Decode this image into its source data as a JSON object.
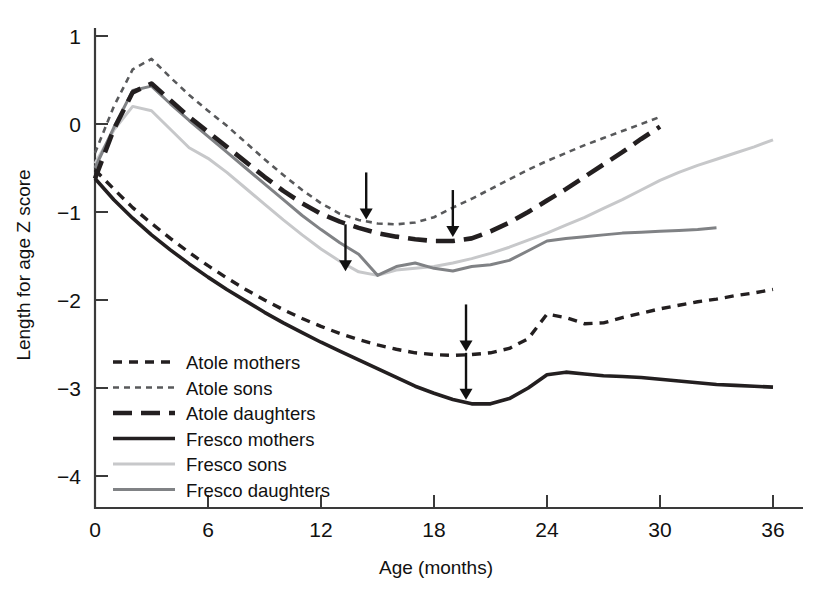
{
  "chart_data": {
    "type": "line",
    "title": "",
    "xlabel": "Age (months)",
    "ylabel": "Length for age Z score",
    "xlim": [
      0,
      36
    ],
    "ylim": [
      -4,
      1
    ],
    "xticks": [
      0,
      6,
      12,
      18,
      24,
      30,
      36
    ],
    "yticks": [
      1,
      0,
      -1,
      -2,
      -3,
      -4
    ],
    "xtick_labels": [
      "0",
      "6",
      "12",
      "18",
      "24",
      "30",
      "36"
    ],
    "ytick_labels": [
      "1",
      "0",
      "−1",
      "−2",
      "−3",
      "−4"
    ],
    "grid": false,
    "legend_position": "lower-left-inside",
    "series": [
      {
        "name": "Atole mothers",
        "style": "dashed",
        "color": "#231f20",
        "x": [
          0,
          1,
          2,
          3,
          4,
          5,
          6,
          7,
          8,
          9,
          10,
          11,
          12,
          13,
          14,
          15,
          16,
          17,
          18,
          19,
          20,
          21,
          22,
          23,
          24,
          25,
          26,
          27,
          28,
          29,
          30,
          31,
          32,
          33,
          34,
          35,
          36
        ],
        "y": [
          -0.52,
          -0.74,
          -0.95,
          -1.13,
          -1.3,
          -1.46,
          -1.61,
          -1.75,
          -1.88,
          -2.0,
          -2.11,
          -2.21,
          -2.3,
          -2.38,
          -2.45,
          -2.51,
          -2.56,
          -2.6,
          -2.62,
          -2.63,
          -2.62,
          -2.6,
          -2.55,
          -2.44,
          -2.16,
          -2.2,
          -2.27,
          -2.26,
          -2.2,
          -2.15,
          -2.1,
          -2.06,
          -2.02,
          -1.99,
          -1.95,
          -1.92,
          -1.88
        ]
      },
      {
        "name": "Atole sons",
        "style": "dashed-fine",
        "color": "#58595b",
        "x": [
          0,
          1,
          2,
          3,
          4,
          5,
          6,
          7,
          8,
          9,
          10,
          11,
          12,
          13,
          14,
          15,
          16,
          17,
          18,
          19,
          20,
          21,
          22,
          23,
          24,
          25,
          26,
          27,
          28,
          29,
          30
        ],
        "y": [
          -0.33,
          0.2,
          0.62,
          0.74,
          0.53,
          0.33,
          0.15,
          -0.02,
          -0.21,
          -0.4,
          -0.58,
          -0.75,
          -0.9,
          -1.02,
          -1.09,
          -1.13,
          -1.14,
          -1.12,
          -1.06,
          -0.95,
          -0.85,
          -0.74,
          -0.63,
          -0.52,
          -0.42,
          -0.33,
          -0.24,
          -0.16,
          -0.08,
          0.0,
          0.08
        ]
      },
      {
        "name": "Atole daughters",
        "style": "long-dash",
        "color": "#231f20",
        "x": [
          0,
          1,
          2,
          3,
          4,
          5,
          6,
          7,
          8,
          9,
          10,
          11,
          12,
          13,
          14,
          15,
          16,
          17,
          18,
          19,
          20,
          21,
          22,
          23,
          24,
          25,
          26,
          27,
          28,
          29,
          30
        ],
        "y": [
          -0.62,
          -0.06,
          0.36,
          0.46,
          0.27,
          0.08,
          -0.09,
          -0.26,
          -0.43,
          -0.6,
          -0.76,
          -0.9,
          -1.02,
          -1.11,
          -1.18,
          -1.24,
          -1.28,
          -1.31,
          -1.33,
          -1.33,
          -1.3,
          -1.22,
          -1.12,
          -1.0,
          -0.87,
          -0.74,
          -0.6,
          -0.46,
          -0.32,
          -0.17,
          -0.03
        ]
      },
      {
        "name": "Fresco mothers",
        "style": "solid",
        "color": "#231f20",
        "x": [
          0,
          1,
          2,
          3,
          4,
          5,
          6,
          7,
          8,
          9,
          10,
          11,
          12,
          13,
          14,
          15,
          16,
          17,
          18,
          19,
          20,
          21,
          22,
          23,
          24,
          25,
          26,
          27,
          28,
          29,
          30,
          31,
          32,
          33,
          34,
          35,
          36
        ],
        "y": [
          -0.62,
          -0.86,
          -1.07,
          -1.26,
          -1.43,
          -1.59,
          -1.74,
          -1.88,
          -2.01,
          -2.14,
          -2.26,
          -2.37,
          -2.48,
          -2.58,
          -2.68,
          -2.78,
          -2.88,
          -2.98,
          -3.06,
          -3.13,
          -3.18,
          -3.18,
          -3.12,
          -3.0,
          -2.85,
          -2.82,
          -2.84,
          -2.86,
          -2.87,
          -2.88,
          -2.9,
          -2.92,
          -2.94,
          -2.96,
          -2.97,
          -2.98,
          -2.99
        ]
      },
      {
        "name": "Fresco sons",
        "style": "solid-light",
        "color": "#c7c8ca",
        "x": [
          0,
          1,
          2,
          3,
          4,
          5,
          6,
          7,
          8,
          9,
          10,
          11,
          12,
          13,
          14,
          15,
          16,
          17,
          18,
          19,
          20,
          21,
          22,
          23,
          24,
          25,
          26,
          27,
          28,
          29,
          30,
          31,
          32,
          33,
          34,
          35,
          36
        ],
        "y": [
          -0.45,
          -0.07,
          0.2,
          0.15,
          -0.06,
          -0.27,
          -0.39,
          -0.55,
          -0.73,
          -0.91,
          -1.09,
          -1.26,
          -1.42,
          -1.56,
          -1.68,
          -1.72,
          -1.66,
          -1.64,
          -1.62,
          -1.58,
          -1.53,
          -1.47,
          -1.4,
          -1.32,
          -1.24,
          -1.15,
          -1.06,
          -0.96,
          -0.86,
          -0.75,
          -0.64,
          -0.55,
          -0.47,
          -0.4,
          -0.33,
          -0.26,
          -0.18
        ]
      },
      {
        "name": "Fresco daughters",
        "style": "solid-mid",
        "color": "#808285",
        "x": [
          0,
          1,
          2,
          3,
          4,
          5,
          6,
          7,
          8,
          9,
          10,
          11,
          12,
          13,
          14,
          15,
          16,
          17,
          18,
          19,
          20,
          21,
          22,
          23,
          24,
          25,
          26,
          27,
          28,
          29,
          30,
          31,
          32,
          33
        ],
        "y": [
          -0.5,
          -0.04,
          0.38,
          0.43,
          0.23,
          0.04,
          -0.14,
          -0.32,
          -0.5,
          -0.68,
          -0.86,
          -1.04,
          -1.2,
          -1.35,
          -1.48,
          -1.72,
          -1.62,
          -1.58,
          -1.64,
          -1.67,
          -1.62,
          -1.6,
          -1.55,
          -1.44,
          -1.33,
          -1.3,
          -1.28,
          -1.26,
          -1.24,
          -1.23,
          -1.22,
          -1.21,
          -1.2,
          -1.18
        ]
      }
    ],
    "annotations": [
      {
        "name": "arrow-atole-sons-nadir",
        "x": 14.4,
        "y": -1.13,
        "direction": "down"
      },
      {
        "name": "arrow-fresco-daughters-nadir",
        "x": 13.3,
        "y": -1.72,
        "direction": "down"
      },
      {
        "name": "arrow-atole-daughters-nadir",
        "x": 19.0,
        "y": -1.33,
        "direction": "down"
      },
      {
        "name": "arrow-atole-mothers-nadir",
        "x": 19.7,
        "y": -2.63,
        "direction": "down"
      },
      {
        "name": "arrow-fresco-mothers-nadir",
        "x": 19.7,
        "y": -3.18,
        "direction": "down"
      }
    ]
  },
  "legend": {
    "items": [
      {
        "label": "Atole mothers"
      },
      {
        "label": "Atole sons"
      },
      {
        "label": "Atole daughters"
      },
      {
        "label": "Fresco mothers"
      },
      {
        "label": "Fresco sons"
      },
      {
        "label": "Fresco daughters"
      }
    ]
  }
}
